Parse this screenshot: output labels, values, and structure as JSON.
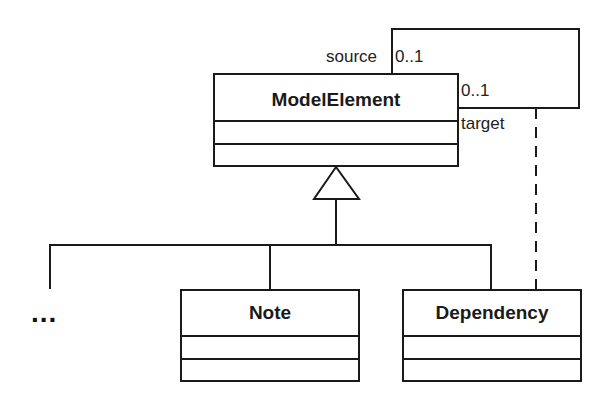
{
  "diagram": {
    "type": "uml-class-diagram",
    "classes": [
      {
        "id": "model-element",
        "name": "ModelElement"
      },
      {
        "id": "note",
        "name": "Note"
      },
      {
        "id": "dependency",
        "name": "Dependency"
      }
    ],
    "self_association": {
      "source_role": "source",
      "source_multiplicity": "0..1",
      "target_role": "target",
      "target_multiplicity": "0..1"
    },
    "ellipsis": "...",
    "relationships": [
      {
        "type": "generalization",
        "from": "note",
        "to": "model-element"
      },
      {
        "type": "generalization",
        "from": "dependency",
        "to": "model-element"
      },
      {
        "type": "generalization",
        "from": "...",
        "to": "model-element"
      },
      {
        "type": "association-class-link",
        "from": "dependency",
        "to": "self_association",
        "style": "dashed"
      }
    ]
  }
}
